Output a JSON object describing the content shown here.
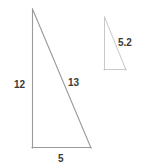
{
  "figure": {
    "type": "geometry-diagram",
    "stroke_color": "#9a9a9a",
    "small_stroke_color": "#c8c8c8",
    "text_color": "#3a3a3a",
    "background_color": "#ffffff",
    "large_triangle": {
      "name": "large-right-triangle",
      "apex": {
        "x": 32,
        "y": 9
      },
      "bottom_left": {
        "x": 32,
        "y": 148
      },
      "bottom_right": {
        "x": 91,
        "y": 148
      },
      "labels": {
        "vertical_leg": "12",
        "hypotenuse": "13",
        "base": "5"
      }
    },
    "small_triangle": {
      "name": "small-right-triangle",
      "apex": {
        "x": 104,
        "y": 17
      },
      "bottom_left": {
        "x": 104,
        "y": 70
      },
      "bottom_right": {
        "x": 126,
        "y": 70
      },
      "labels": {
        "hypotenuse": "5.2"
      }
    }
  }
}
